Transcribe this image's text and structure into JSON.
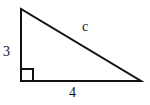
{
  "figure": {
    "type": "right-triangle",
    "triangle_points": "21,9 21,81 141,81",
    "right_angle_marker_points": "21,69 33,69 33,81",
    "stroke_color": "#111111",
    "labels": {
      "vertical_leg": "3",
      "horizontal_leg": "4",
      "hypotenuse": "c"
    }
  }
}
